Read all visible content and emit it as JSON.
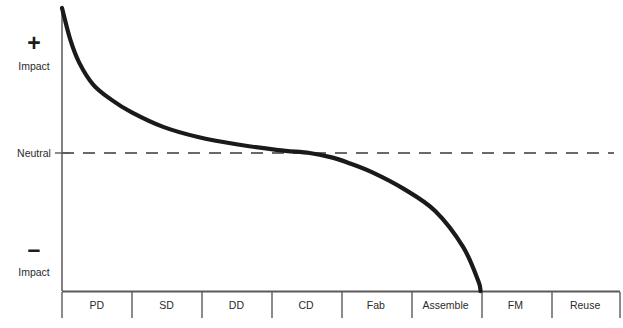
{
  "chart_data": {
    "type": "line",
    "title": "",
    "xlabel": "",
    "ylabel": "Impact",
    "grid": false,
    "legend": null,
    "categories": [
      "PD",
      "SD",
      "DD",
      "CD",
      "Fab",
      "Assemble",
      "FM",
      "Reuse"
    ],
    "y_tick_labels": [
      "+ Impact",
      "Neutral",
      "- Impact"
    ],
    "ylim": [
      -1,
      1
    ],
    "reference_line": {
      "label": "Neutral",
      "value": 0,
      "style": "dashed",
      "color": "#3a3a3a"
    },
    "series": [
      {
        "name": "Impact",
        "color": "#1a1a1a",
        "x": [
          0.0,
          0.12,
          0.25,
          0.45,
          0.7,
          1.0,
          1.45,
          1.95,
          2.5,
          3.1,
          3.55,
          3.85,
          4.1,
          4.45,
          4.9,
          5.35,
          5.75,
          5.97,
          6.0
        ],
        "y": [
          1.0,
          0.78,
          0.62,
          0.47,
          0.37,
          0.28,
          0.18,
          0.11,
          0.06,
          0.02,
          0.0,
          -0.03,
          -0.07,
          -0.14,
          -0.26,
          -0.42,
          -0.68,
          -0.93,
          -1.0
        ]
      }
    ],
    "annotations": []
  },
  "axes": {
    "y_positive_symbol": "+",
    "y_positive_label": "Impact",
    "y_neutral_label": "Neutral",
    "y_negative_symbol": "–",
    "y_negative_label": "Impact"
  },
  "colors": {
    "curve": "#1a1a1a",
    "axis": "#5a5a5a",
    "dashed": "#3a3a3a",
    "text": "#2b2b2b",
    "background": "#ffffff"
  }
}
